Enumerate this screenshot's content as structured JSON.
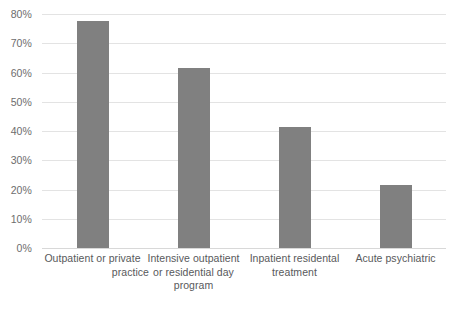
{
  "chart_data": {
    "type": "bar",
    "title": "",
    "subtitle": "",
    "xlabel": "",
    "ylabel": "",
    "categories": [
      "Outpatient or private practice",
      "Intensive outpatient or residential day program",
      "Inpatient residental treatment",
      "Acute psychiatric"
    ],
    "category_lines": [
      [
        "Outpatient or private",
        "practice"
      ],
      [
        "Intensive outpatient",
        "or residential day",
        "program"
      ],
      [
        "Inpatient residental",
        "treatment"
      ],
      [
        "Acute psychiatric"
      ]
    ],
    "values": [
      77.5,
      61.5,
      41.5,
      21.5
    ],
    "ylim": [
      0,
      80
    ],
    "ytick_values": [
      0,
      10,
      20,
      30,
      40,
      50,
      60,
      70,
      80
    ],
    "ytick_labels": [
      "0%",
      "10%",
      "20%",
      "30%",
      "40%",
      "50%",
      "60%",
      "70%",
      "80%"
    ],
    "grid": true,
    "legend": false,
    "legend_position": "none",
    "bar_color": "#808080",
    "gridline_color": "#e3e3e3",
    "axis_label_color": "#58595b",
    "tick_label_color": "#6d6d6d",
    "background_color": "#ffffff"
  }
}
